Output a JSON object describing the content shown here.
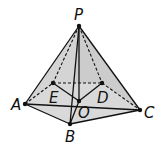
{
  "diagram": {
    "points": {
      "P": {
        "label": "P",
        "x": 79,
        "y": 26
      },
      "A": {
        "label": "A",
        "x": 25,
        "y": 104
      },
      "B": {
        "label": "B",
        "x": 70,
        "y": 124
      },
      "C": {
        "label": "C",
        "x": 140,
        "y": 110
      },
      "D": {
        "label": "D",
        "x": 102,
        "y": 83
      },
      "E": {
        "label": "E",
        "x": 53,
        "y": 83
      },
      "O": {
        "label": "O",
        "x": 79,
        "y": 101
      }
    },
    "colors": {
      "face_fill": "#d4d4d4",
      "stroke": "#111111"
    }
  }
}
